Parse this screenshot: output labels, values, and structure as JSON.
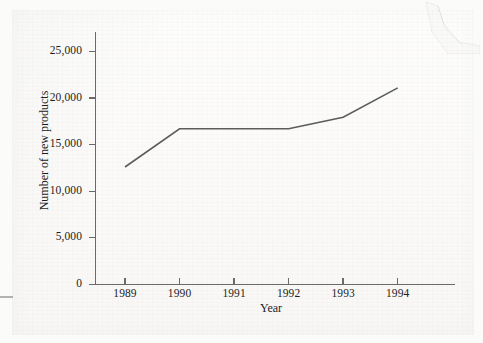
{
  "page": {
    "background_color": "#fbfaf8",
    "artifacts": {
      "corner_fold_name": "torn-page-corner",
      "edge_mark_name": "page-edge-mark"
    }
  },
  "chart_data": {
    "type": "line",
    "title": "",
    "subtitle": "",
    "xlabel": "Year",
    "ylabel": "Number of new products",
    "categories": [
      "1989",
      "1990",
      "1991",
      "1992",
      "1993",
      "1994"
    ],
    "x": [
      1989,
      1990,
      1991,
      1992,
      1993,
      1994
    ],
    "values": [
      12600,
      16700,
      16700,
      16700,
      17950,
      21100
    ],
    "series": [
      {
        "name": "Number of new products",
        "values": [
          12600,
          16700,
          16700,
          16700,
          17950,
          21100
        ]
      }
    ],
    "ylim": [
      0,
      27100
    ],
    "xlim": [
      1988.45,
      1995.05
    ],
    "ytick_labels": [
      "0",
      "5,000",
      "10,000",
      "15,000",
      "20,000",
      "25,000"
    ],
    "ytick_values": [
      0,
      5000,
      10000,
      15000,
      20000,
      25000
    ],
    "xtick_labels": [
      "1989",
      "1990",
      "1991",
      "1992",
      "1993",
      "1994"
    ],
    "grid": false,
    "legend": false,
    "legend_position": "none",
    "line_color": "#5c5c5c",
    "axis_color": "#6a6a6a",
    "text_color": "#1d1d1d",
    "markers": false
  }
}
